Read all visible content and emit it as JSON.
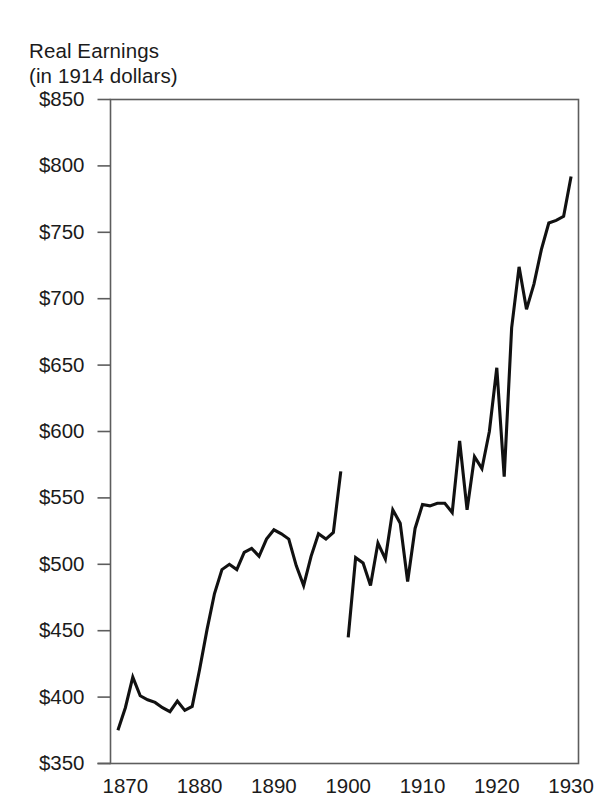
{
  "chart_data": {
    "type": "line",
    "title_line1": "Real Earnings",
    "title_line2": "(in 1914 dollars)",
    "xlabel": "",
    "ylabel": "Real Earnings (in 1914 dollars)",
    "xlim": [
      1868,
      1931
    ],
    "ylim": [
      350,
      850
    ],
    "grid": false,
    "legend": "none",
    "ytick_labels": [
      "$850",
      "$800",
      "$750",
      "$700",
      "$650",
      "$600",
      "$550",
      "$500",
      "$450",
      "$400",
      "$350"
    ],
    "ytick_values": [
      850,
      800,
      750,
      700,
      650,
      600,
      550,
      500,
      450,
      400,
      350
    ],
    "xtick_labels": [
      "1870",
      "1880",
      "1890",
      "1900",
      "1910",
      "1920",
      "1930"
    ],
    "xtick_values": [
      1870,
      1880,
      1890,
      1900,
      1910,
      1920,
      1930
    ],
    "line_color": "#111111",
    "axis_color": "#5d5d5d",
    "series": [
      {
        "name": "Real earnings 1869-1899",
        "x": [
          1869,
          1870,
          1871,
          1872,
          1873,
          1874,
          1875,
          1876,
          1877,
          1878,
          1879,
          1880,
          1881,
          1882,
          1883,
          1884,
          1885,
          1886,
          1887,
          1888,
          1889,
          1890,
          1891,
          1892,
          1893,
          1894,
          1895,
          1896,
          1897,
          1898,
          1899
        ],
        "values": [
          375,
          392,
          415,
          401,
          398,
          396,
          392,
          389,
          397,
          390,
          393,
          421,
          451,
          478,
          496,
          500,
          496,
          509,
          512,
          506,
          519,
          526,
          523,
          519,
          499,
          484,
          506,
          523,
          519,
          524,
          570
        ]
      },
      {
        "name": "Real earnings 1900-1930",
        "x": [
          1900,
          1901,
          1902,
          1903,
          1904,
          1905,
          1906,
          1907,
          1908,
          1909,
          1910,
          1911,
          1912,
          1913,
          1914,
          1915,
          1916,
          1917,
          1918,
          1919,
          1920,
          1921,
          1922,
          1923,
          1924,
          1925,
          1926,
          1927,
          1928,
          1929,
          1930
        ],
        "values": [
          445,
          505,
          501,
          484,
          516,
          504,
          541,
          531,
          487,
          527,
          545,
          544,
          546,
          546,
          539,
          593,
          541,
          581,
          572,
          600,
          648,
          566,
          678,
          724,
          692,
          711,
          737,
          757,
          759,
          762,
          792
        ]
      }
    ]
  }
}
